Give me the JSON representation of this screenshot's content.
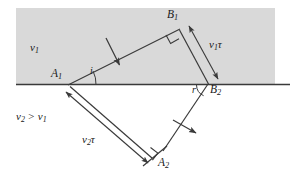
{
  "figure": {
    "type": "physics-diagram",
    "topic": "huygens-construction-refraction",
    "background_color": "#ffffff",
    "medium_shade_color": "#d9d9d9",
    "line_color": "#3a3a3a",
    "labels": {
      "medium1_speed": "v",
      "medium1_speed_sub": "1",
      "medium_inequality_left": "v",
      "medium_inequality_left_sub": "2",
      "medium_inequality_op": " > ",
      "medium_inequality_right": "v",
      "medium_inequality_right_sub": "1",
      "point_a1": "A",
      "point_a1_sub": "1",
      "point_b1": "B",
      "point_b1_sub": "1",
      "point_a2": "A",
      "point_a2_sub": "2",
      "point_b2": "B",
      "point_b2_sub": "2",
      "angle_incidence": "i",
      "angle_refraction": "r",
      "wavefront_top": "v",
      "wavefront_top_sub": "1",
      "wavefront_top_tau": "τ",
      "wavefront_bottom": "v",
      "wavefront_bottom_sub": "2",
      "wavefront_bottom_tau": "τ"
    },
    "geometry": {
      "interface_y": 84,
      "interface_x_start": 16,
      "interface_x_end": 290,
      "shade_rect": {
        "x": 16,
        "y": 8,
        "width": 259,
        "height": 76
      },
      "point_a1": {
        "x": 68,
        "y": 85
      },
      "point_b1": {
        "x": 178,
        "y": 30
      },
      "point_b2": {
        "x": 208,
        "y": 84
      },
      "point_a2": {
        "x": 150,
        "y": 160
      }
    }
  }
}
